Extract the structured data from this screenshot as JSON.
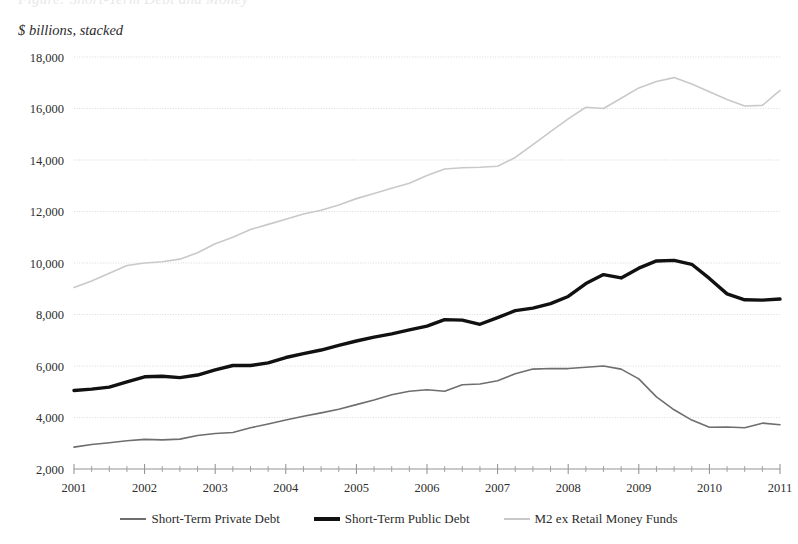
{
  "clipped_title": "Figure: Short-Term Debt and Money",
  "axis_note": "$ billions, stacked",
  "legend": {
    "items": [
      {
        "label": "Short-Term Private Debt",
        "color": "#6e6e6e",
        "width": 1.6
      },
      {
        "label": "Short-Term Public Debt",
        "color": "#111111",
        "width": 3.4
      },
      {
        "label": "M2 ex Retail Money Funds",
        "color": "#c9c9c9",
        "width": 1.6
      }
    ]
  },
  "chart_data": {
    "type": "line",
    "title": "",
    "subtitle": "$ billions, stacked",
    "xlabel": "",
    "ylabel": "$ billions, stacked",
    "xlim": [
      2001,
      2011
    ],
    "ylim": [
      2000,
      18000
    ],
    "ytick_step": 2000,
    "grid": true,
    "legend_position": "bottom",
    "x_tick_labels": [
      "2001",
      "2002",
      "2003",
      "2004",
      "2005",
      "2006",
      "2007",
      "2008",
      "2009",
      "2010",
      "2011"
    ],
    "y_tick_labels": [
      "2,000",
      "4,000",
      "6,000",
      "8,000",
      "10,000",
      "12,000",
      "14,000",
      "16,000",
      "18,000"
    ],
    "minor_ticks_per_year": 4,
    "x": [
      2001.0,
      2001.25,
      2001.5,
      2001.75,
      2002.0,
      2002.25,
      2002.5,
      2002.75,
      2003.0,
      2003.25,
      2003.5,
      2003.75,
      2004.0,
      2004.25,
      2004.5,
      2004.75,
      2005.0,
      2005.25,
      2005.5,
      2005.75,
      2006.0,
      2006.25,
      2006.5,
      2006.75,
      2007.0,
      2007.25,
      2007.5,
      2007.75,
      2008.0,
      2008.25,
      2008.5,
      2008.75,
      2009.0,
      2009.25,
      2009.5,
      2009.75,
      2010.0,
      2010.25,
      2010.5,
      2010.75,
      2011.0
    ],
    "series": [
      {
        "name": "Short-Term Private Debt",
        "color": "#6e6e6e",
        "width": 1.6,
        "values": [
          2850,
          2950,
          3020,
          3100,
          3150,
          3130,
          3160,
          3300,
          3380,
          3420,
          3600,
          3750,
          3900,
          4050,
          4180,
          4320,
          4500,
          4680,
          4880,
          5020,
          5080,
          5020,
          5270,
          5300,
          5430,
          5700,
          5880,
          5900,
          5900,
          5950,
          6000,
          5880,
          5500,
          4800,
          4300,
          3900,
          3620,
          3630,
          3600,
          3780,
          3720
        ]
      },
      {
        "name": "Short-Term Public Debt",
        "color": "#111111",
        "width": 3.4,
        "values": [
          5050,
          5100,
          5180,
          5380,
          5580,
          5600,
          5550,
          5650,
          5850,
          6020,
          6020,
          6120,
          6330,
          6480,
          6620,
          6800,
          6970,
          7120,
          7250,
          7400,
          7550,
          7800,
          7780,
          7620,
          7880,
          8150,
          8250,
          8420,
          8700,
          9200,
          9550,
          9420,
          9800,
          10080,
          10100,
          9950,
          9400,
          8800,
          8570,
          8560,
          8600
        ]
      },
      {
        "name": "M2 ex Retail Money Funds",
        "color": "#c9c9c9",
        "width": 1.6,
        "values": [
          9050,
          9300,
          9600,
          9900,
          10000,
          10050,
          10150,
          10400,
          10750,
          11000,
          11300,
          11500,
          11700,
          11900,
          12050,
          12250,
          12500,
          12700,
          12900,
          13100,
          13400,
          13650,
          13700,
          13720,
          13760,
          14100,
          14600,
          15100,
          15600,
          16050,
          16000,
          16400,
          16800,
          17050,
          17200,
          16950,
          16650,
          16350,
          16100,
          16120,
          16300
        ]
      }
    ],
    "series_final_point": {
      "M2 ex Retail Money Funds": 16700
    }
  }
}
